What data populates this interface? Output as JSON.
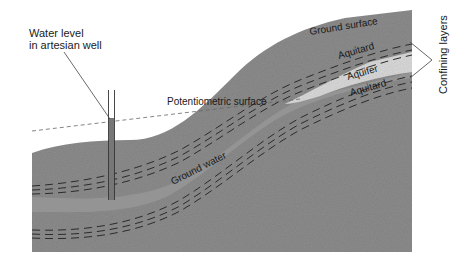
{
  "diagram": {
    "type": "cross-section",
    "labels": {
      "well_label_line1": "Water level",
      "well_label_line2": "in artesian well",
      "potentiometric_surface": "Potentiometric surface",
      "ground_surface": "Ground surface",
      "aquitard_upper": "Aquitard",
      "aquifer": "Aquifer",
      "aquitard_lower": "Aquitard",
      "ground_water": "Ground water",
      "confining_layers": "Confining layers"
    },
    "colors": {
      "rock": "#8c8c8c",
      "rock_dark": "#7d7d7d",
      "aquifer": "#d9d9d9",
      "groundwater_band": "#9a9a9a",
      "dash": "#2b2b2b",
      "text": "#1a1a1a",
      "leader": "#555555"
    }
  }
}
